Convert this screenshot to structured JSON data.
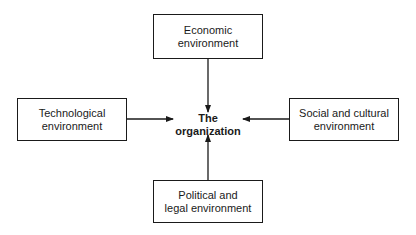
{
  "diagram": {
    "center": {
      "line1": "The",
      "line2": "organization"
    },
    "nodes": {
      "top": {
        "line1": "Economic environment",
        "line2": ""
      },
      "left": {
        "line1": "Technological",
        "line2": "environment"
      },
      "right": {
        "line1": "Social and cultural",
        "line2": "environment"
      },
      "bottom": {
        "line1": "Political and",
        "line2": "legal environment"
      }
    },
    "edges": [
      {
        "from": "top",
        "to": "center"
      },
      {
        "from": "left",
        "to": "center"
      },
      {
        "from": "right",
        "to": "center"
      },
      {
        "from": "bottom",
        "to": "center"
      }
    ],
    "line_color": "#1a1a1a"
  }
}
